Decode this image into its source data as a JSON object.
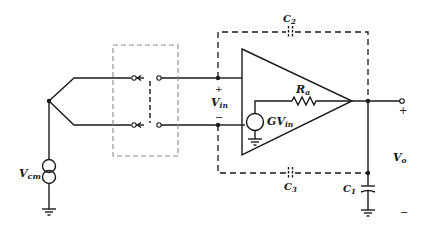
{
  "figure": {
    "type": "circuit-schematic"
  },
  "labels": {
    "c2": {
      "main": "C",
      "sub": "2"
    },
    "c3": {
      "main": "C",
      "sub": "3"
    },
    "c1": {
      "main": "C",
      "sub": "1"
    },
    "ra": {
      "main": "R",
      "sub": "a"
    },
    "vin": {
      "main": "V",
      "sub": "in"
    },
    "gvin": {
      "main": "GV",
      "sub": "in"
    },
    "vcm": {
      "main": "V",
      "sub": "cm"
    },
    "vo": {
      "main": "V",
      "sub": "o"
    },
    "vin_plus": "+",
    "vin_minus": "−",
    "out_plus": "+",
    "out_minus": "−"
  },
  "components": [
    {
      "id": "thermocouple",
      "kind": "thermocouple-junction"
    },
    {
      "id": "switch",
      "kind": "double-pole switch",
      "enclosure": "gray dashed box"
    },
    {
      "id": "amplifier",
      "kind": "op-amp",
      "internal": [
        "GV_in dependent source",
        "R_a output resistance"
      ]
    },
    {
      "id": "guard",
      "kind": "dashed shield enclosure"
    },
    {
      "id": "C2",
      "kind": "stray capacitor (dashed)"
    },
    {
      "id": "C3",
      "kind": "stray capacitor (dashed)"
    },
    {
      "id": "C1",
      "kind": "capacitor to ground"
    },
    {
      "id": "Vcm",
      "kind": "common-mode source"
    }
  ],
  "colors": {
    "line": "#1a1a1a",
    "switch_box": "#8a8a8a",
    "background": "#ffffff"
  }
}
